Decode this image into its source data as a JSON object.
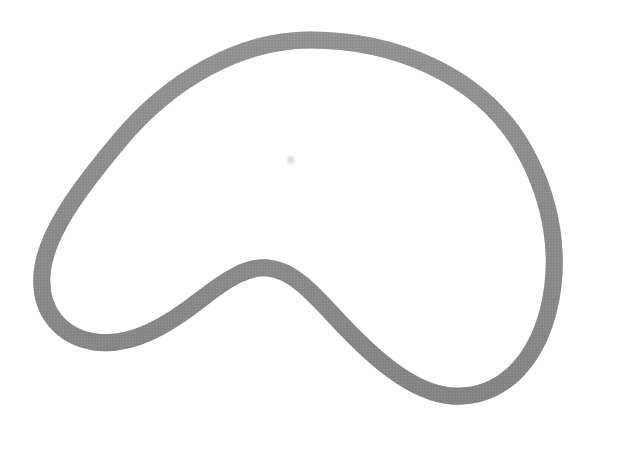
{
  "document": {
    "title": "Closed freeform curve figure",
    "description": "A single closed, smooth freeform outline resembling a kidney or bean shape, drawn as a thick gray stroke on a white background.",
    "background_color": "#fefefe",
    "canvas": {
      "width": 623,
      "height": 453
    }
  },
  "figure": {
    "name": "kidney-bean-closed-curve",
    "stroke_color": "#8c8c8c",
    "stroke_color_dark": "#7c7c7c",
    "stroke_color_light": "#a2a2a2",
    "fill_color": "none",
    "stroke_width_px": 17,
    "texture": "halftone-dot",
    "landmarks": {
      "top_apex": [
        310,
        34
      ],
      "leftmost": [
        35,
        270
      ],
      "bottom_left_lobe": [
        110,
        341
      ],
      "concave_notch_apex": [
        265,
        265
      ],
      "bottom_right_lobe": [
        475,
        393
      ],
      "rightmost": [
        558,
        265
      ]
    },
    "path": "M 310 40 C 240 40 170 80 120 140 C 78 190 45 235 42 274 C 39 312 62 337 95 342 C 132 347 168 325 200 300 C 228 278 248 266 268 268 C 292 270 312 292 336 318 C 372 357 412 393 452 396 C 500 399 534 364 548 312 C 562 258 552 200 524 150 C 480 72 390 40 310 40 Z"
  },
  "artifacts": {
    "interior_smudge": {
      "name": "interior-smudge-mark",
      "position": [
        287,
        155
      ],
      "size": [
        9,
        11
      ],
      "color": "#969696"
    }
  }
}
